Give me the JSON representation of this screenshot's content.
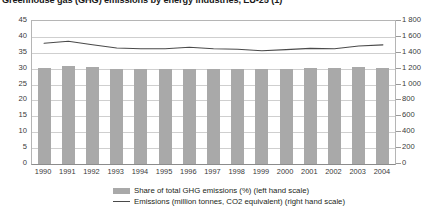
{
  "chart_data": {
    "type": "bar",
    "title": "Greenhouse gas (GHG) emissions by energy industries, EU-25 (1)",
    "xlabel": "",
    "ylabel": "",
    "grid": true,
    "legend_position": "bottom",
    "categories": [
      "1990",
      "1991",
      "1992",
      "1993",
      "1994",
      "1995",
      "1996",
      "1997",
      "1998",
      "1999",
      "2000",
      "2001",
      "2002",
      "2003",
      "2004"
    ],
    "axes": {
      "left": {
        "label": "Share of total GHG emissions (%)",
        "min": 0,
        "max": 45,
        "step": 5,
        "ticks": [
          "0",
          "5",
          "10",
          "15",
          "20",
          "25",
          "30",
          "35",
          "40",
          "45"
        ]
      },
      "right": {
        "label": "Emissions (million tonnes, CO2 equivalent)",
        "min": 0,
        "max": 1800,
        "step": 200,
        "ticks": [
          "0",
          "200",
          "400",
          "600",
          "800",
          "1 000",
          "1 200",
          "1 400",
          "1 600",
          "1 800"
        ]
      }
    },
    "series": [
      {
        "name": "Share of total GHG emissions (%) (left hand scale)",
        "type": "bar",
        "axis": "left",
        "color": "#a9a9a9",
        "values": [
          30.2,
          30.8,
          30.6,
          30.0,
          29.9,
          29.9,
          29.9,
          29.8,
          29.9,
          29.9,
          30.0,
          30.1,
          30.1,
          30.5,
          30.3
        ]
      },
      {
        "name": "Emissions (million tonnes, CO2 equivalent) (right hand scale)",
        "type": "line",
        "axis": "right",
        "color": "#4a4a4a",
        "values": [
          1520,
          1545,
          1500,
          1460,
          1450,
          1450,
          1470,
          1450,
          1445,
          1425,
          1440,
          1455,
          1450,
          1485,
          1500
        ]
      }
    ]
  },
  "legend": {
    "entries": [
      {
        "label": "Share of total GHG emissions (%) (left hand scale)",
        "marker": "bar-swatch-icon"
      },
      {
        "label": "Emissions (million tonnes, CO2 equivalent) (right hand scale)",
        "marker": "line-swatch-icon"
      }
    ]
  }
}
